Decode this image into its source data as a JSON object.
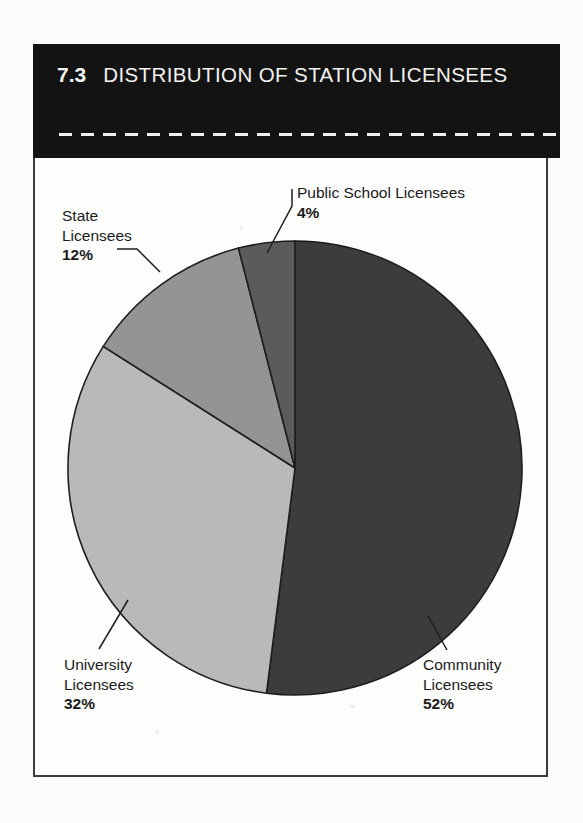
{
  "header": {
    "number": "7.3",
    "title": "DISTRIBUTION OF STATION LICENSEES",
    "divider_icon": "dashed-rule-icon"
  },
  "labels": {
    "public_school": {
      "name": "Public School Licensees",
      "value": "4%"
    },
    "state": {
      "name_line1": "State",
      "name_line2": "Licensees",
      "value": "12%"
    },
    "university": {
      "name_line1": "University",
      "name_line2": "Licensees",
      "value": "32%"
    },
    "community": {
      "name_line1": "Community",
      "name_line2": "Licensees",
      "value": "52%"
    }
  },
  "colors": {
    "community": "#3c3c3c",
    "university": "#b9b9b7",
    "state": "#949492",
    "public_school": "#5b5b5a",
    "slice_outline": "#1f1f1f",
    "header_background": "#131313",
    "header_text": "#f2f2f0",
    "panel_border": "#3c3c3c",
    "label_text": "#1b1b1b"
  },
  "chart_data": {
    "type": "pie",
    "title": "DISTRIBUTION OF STATION LICENSEES",
    "figure_number": "7.3",
    "categories": [
      "Community Licensees",
      "University Licensees",
      "State Licensees",
      "Public School Licensees"
    ],
    "values": [
      52,
      32,
      12,
      4
    ],
    "value_labels": [
      "52%",
      "32%",
      "12%",
      "4%"
    ],
    "units": "percent",
    "total": 100,
    "start_angle_deg": 0,
    "direction": "clockwise",
    "legend": "none",
    "labels_position": "outside-with-leader-lines",
    "grid": false,
    "slice_colors": [
      "#3c3c3c",
      "#b9b9b7",
      "#949492",
      "#5b5b5a"
    ],
    "geometry": {
      "center_x": 295,
      "center_y": 468,
      "radius": 227
    }
  }
}
